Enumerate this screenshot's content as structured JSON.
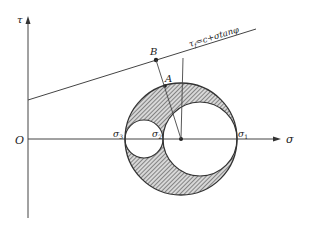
{
  "diagram": {
    "type": "mohr-circle",
    "axes": {
      "x_label": "σ",
      "y_label": "τ",
      "origin_label": "O"
    },
    "principal_stresses": {
      "sigma1_label": "σ",
      "sigma1_sub": "1",
      "sigma2_label": "σ",
      "sigma2_sub": "2",
      "sigma3_label": "σ",
      "sigma3_sub": "3"
    },
    "envelope": {
      "label_tau": "τ",
      "label_tau_sub": "f",
      "label_rest": "=c+σtanφ"
    },
    "points": {
      "A": "A",
      "B": "B"
    },
    "colors": {
      "line": "#333333",
      "hatch": "#555555",
      "background": "#ffffff"
    }
  }
}
